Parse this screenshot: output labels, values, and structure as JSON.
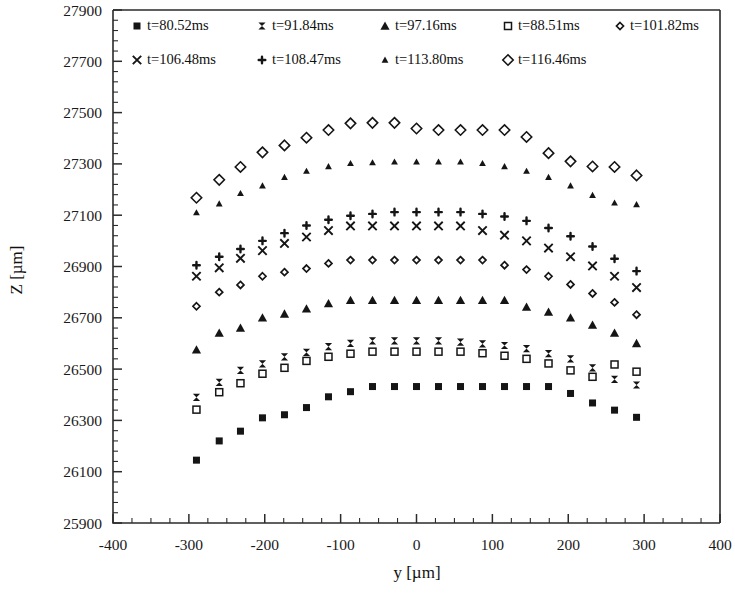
{
  "chart_data": {
    "type": "scatter",
    "title": "",
    "xlabel": "y [µm]",
    "ylabel": "Z [µm]",
    "xlim": [
      -400,
      400
    ],
    "ylim": [
      25900,
      27900
    ],
    "xticks": [
      -400,
      -300,
      -200,
      -100,
      0,
      100,
      200,
      300,
      400
    ],
    "yticks": [
      25900,
      26100,
      26300,
      26500,
      26700,
      26900,
      27100,
      27300,
      27500,
      27700,
      27900
    ],
    "x_minor_step": 25,
    "y_minor_step": 40,
    "grid": false,
    "legend_position": "top-inside",
    "x": [
      -290,
      -260,
      -232,
      -203,
      -174,
      -145,
      -116,
      -87,
      -58,
      -29,
      0,
      29,
      58,
      87,
      116,
      145,
      174,
      203,
      232,
      261,
      290
    ],
    "series": [
      {
        "name": "t=80.52ms",
        "marker": "filled-square",
        "values": [
          26145,
          26220,
          26258,
          26310,
          26322,
          26350,
          26392,
          26412,
          26432,
          26432,
          26432,
          26432,
          26432,
          26432,
          26432,
          26432,
          26432,
          26405,
          26368,
          26340,
          26312
        ]
      },
      {
        "name": "t=91.84ms",
        "marker": "bowtie",
        "values": [
          26390,
          26448,
          26495,
          26520,
          26548,
          26565,
          26588,
          26600,
          26610,
          26610,
          26610,
          26610,
          26605,
          26598,
          26592,
          26580,
          26560,
          26540,
          26505,
          26460,
          26438
        ]
      },
      {
        "name": "t=97.16ms",
        "marker": "filled-triangle",
        "values": [
          26575,
          26640,
          26660,
          26700,
          26715,
          26735,
          26755,
          26768,
          26768,
          26768,
          26768,
          26768,
          26768,
          26768,
          26768,
          26742,
          26722,
          26700,
          26672,
          26640,
          26600
        ]
      },
      {
        "name": "t=88.51ms",
        "marker": "open-square",
        "values": [
          26342,
          26410,
          26445,
          26482,
          26505,
          26532,
          26548,
          26560,
          26568,
          26568,
          26568,
          26568,
          26568,
          26562,
          26552,
          26540,
          26522,
          26495,
          26470,
          26518,
          26490
        ]
      },
      {
        "name": "t=101.82ms",
        "marker": "small-open-diamond",
        "values": [
          26745,
          26800,
          26828,
          26862,
          26878,
          26892,
          26912,
          26925,
          26925,
          26925,
          26925,
          26925,
          26925,
          26925,
          26905,
          26888,
          26862,
          26830,
          26795,
          26760,
          26712
        ]
      },
      {
        "name": "t=106.48ms",
        "marker": "cross-x",
        "values": [
          26862,
          26895,
          26932,
          26962,
          26990,
          27015,
          27040,
          27058,
          27058,
          27058,
          27058,
          27058,
          27058,
          27040,
          27022,
          27000,
          26972,
          26938,
          26902,
          26862,
          26818
        ]
      },
      {
        "name": "t=108.47ms",
        "marker": "plus-dot",
        "values": [
          26905,
          26938,
          26968,
          27000,
          27030,
          27060,
          27082,
          27098,
          27105,
          27112,
          27112,
          27112,
          27112,
          27105,
          27095,
          27078,
          27050,
          27018,
          26978,
          26930,
          26882
        ]
      },
      {
        "name": "t=113.80ms",
        "marker": "small-triangle",
        "values": [
          27110,
          27145,
          27185,
          27215,
          27248,
          27272,
          27290,
          27302,
          27305,
          27308,
          27308,
          27308,
          27308,
          27302,
          27290,
          27272,
          27248,
          27215,
          27178,
          27148,
          27142
        ]
      },
      {
        "name": "t=116.46ms",
        "marker": "open-diamond",
        "values": [
          27168,
          27238,
          27288,
          27345,
          27372,
          27402,
          27432,
          27458,
          27460,
          27460,
          27438,
          27432,
          27432,
          27432,
          27432,
          27405,
          27342,
          27310,
          27290,
          27288,
          27255
        ]
      }
    ],
    "legend_rows": [
      [
        "t=80.52ms",
        "t=91.84ms",
        "t=97.16ms",
        "t=88.51ms",
        "t=101.82ms"
      ],
      [
        "t=106.48ms",
        "t=108.47ms",
        "t=113.80ms",
        "t=116.46ms"
      ]
    ]
  },
  "colors": {
    "axis": "#2b2b2b",
    "marker": "#151515",
    "background": "#ffffff"
  }
}
